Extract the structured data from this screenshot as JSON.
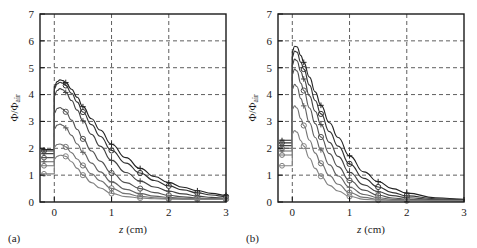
{
  "figure": {
    "panels": [
      {
        "id": "panel-a",
        "label": "(a)",
        "xlabel_italic": "z",
        "xlabel_unit": " (cm)",
        "ylabel_main": "Φ/Φ",
        "ylabel_sub": "air"
      },
      {
        "id": "panel-b",
        "label": "(b)",
        "xlabel_italic": "z",
        "xlabel_unit": " (cm)",
        "ylabel_main": "Φ/Φ",
        "ylabel_sub": "air"
      }
    ]
  },
  "chart_data": [
    {
      "type": "line",
      "panel": "(a)",
      "title": "",
      "xlabel": "z (cm)",
      "ylabel": "Φ/Φair",
      "xlim": [
        -0.25,
        3.0
      ],
      "ylim": [
        0,
        7
      ],
      "xticks": [
        0,
        1,
        2,
        3
      ],
      "yticks": [
        0,
        1,
        2,
        3,
        4,
        5,
        6,
        7
      ],
      "grid": true,
      "grid_style": "dashed",
      "legend": "none",
      "marker_set": [
        "circle",
        "plus"
      ],
      "x": [
        -0.22,
        -0.12,
        -0.03,
        0.0,
        0.05,
        0.1,
        0.15,
        0.2,
        0.3,
        0.4,
        0.5,
        0.65,
        0.8,
        1.0,
        1.25,
        1.5,
        1.75,
        2.0,
        2.25,
        2.5,
        2.75,
        3.0
      ],
      "series": [
        {
          "name": "curve-1",
          "marker": "plus",
          "plateau": 1.95,
          "values": [
            1.95,
            1.95,
            1.95,
            4.3,
            4.48,
            4.55,
            4.52,
            4.45,
            4.2,
            3.9,
            3.55,
            3.1,
            2.68,
            2.15,
            1.65,
            1.25,
            0.95,
            0.72,
            0.55,
            0.42,
            0.32,
            0.25
          ],
          "marker_x": [
            0.2,
            0.5,
            1.0,
            1.5,
            2.0,
            2.5,
            3.0
          ]
        },
        {
          "name": "curve-2",
          "marker": "circle",
          "plateau": 1.9,
          "values": [
            1.9,
            1.9,
            1.9,
            4.22,
            4.4,
            4.46,
            4.42,
            4.34,
            4.05,
            3.72,
            3.35,
            2.88,
            2.45,
            1.92,
            1.45,
            1.08,
            0.8,
            0.6,
            0.45,
            0.34,
            0.26,
            0.2
          ],
          "marker_x": [
            0.2,
            0.5,
            1.0,
            1.5,
            2.0,
            2.5,
            3.0
          ]
        },
        {
          "name": "curve-3",
          "marker": "plus",
          "plateau": 1.8,
          "values": [
            1.8,
            1.8,
            1.8,
            3.95,
            4.15,
            4.22,
            4.18,
            4.08,
            3.78,
            3.42,
            3.02,
            2.52,
            2.08,
            1.55,
            1.1,
            0.78,
            0.56,
            0.4,
            0.3,
            0.22,
            0.17,
            0.14
          ],
          "marker_x": [
            0.2,
            0.5,
            1.0,
            1.5,
            2.0,
            2.5,
            3.0
          ]
        },
        {
          "name": "curve-4",
          "marker": "circle",
          "plateau": 1.65,
          "values": [
            1.65,
            1.65,
            1.65,
            3.3,
            3.48,
            3.52,
            3.46,
            3.36,
            3.05,
            2.7,
            2.35,
            1.9,
            1.52,
            1.08,
            0.72,
            0.5,
            0.35,
            0.25,
            0.19,
            0.15,
            0.13,
            0.12
          ],
          "marker_x": [
            0.2,
            0.5,
            1.0,
            1.5,
            2.0,
            2.5,
            3.0
          ]
        },
        {
          "name": "curve-5",
          "marker": "plus",
          "plateau": 1.5,
          "values": [
            1.5,
            1.5,
            1.5,
            2.72,
            2.86,
            2.9,
            2.85,
            2.76,
            2.48,
            2.16,
            1.85,
            1.45,
            1.12,
            0.75,
            0.47,
            0.31,
            0.22,
            0.17,
            0.14,
            0.13,
            0.12,
            0.11
          ],
          "marker_x": [
            0.2,
            0.5,
            1.0,
            1.5,
            2.0,
            2.5,
            3.0
          ]
        },
        {
          "name": "curve-6",
          "marker": "circle",
          "plateau": 1.35,
          "values": [
            1.35,
            1.35,
            1.35,
            2.05,
            2.14,
            2.16,
            2.12,
            2.05,
            1.84,
            1.6,
            1.36,
            1.05,
            0.79,
            0.51,
            0.31,
            0.21,
            0.16,
            0.13,
            0.12,
            0.11,
            0.11,
            0.1
          ],
          "marker_x": [
            0.2,
            0.5,
            1.0,
            1.5,
            2.0,
            2.5,
            3.0
          ]
        },
        {
          "name": "curve-7",
          "marker": "circle",
          "plateau": 1.05,
          "values": [
            1.05,
            1.05,
            1.05,
            1.6,
            1.7,
            1.74,
            1.73,
            1.7,
            1.5,
            1.25,
            1.0,
            0.72,
            0.52,
            0.32,
            0.2,
            0.15,
            0.12,
            0.11,
            0.1,
            0.1,
            0.1,
            0.1
          ],
          "marker_x": [
            0.2,
            0.5,
            1.0,
            1.5,
            2.0,
            2.5,
            3.0
          ]
        }
      ]
    },
    {
      "type": "line",
      "panel": "(b)",
      "title": "",
      "xlabel": "z (cm)",
      "ylabel": "Φ/Φair",
      "xlim": [
        -0.25,
        3.0
      ],
      "ylim": [
        0,
        7
      ],
      "xticks": [
        0,
        1,
        2,
        3
      ],
      "yticks": [
        0,
        1,
        2,
        3,
        4,
        5,
        6,
        7
      ],
      "grid": true,
      "grid_style": "dashed",
      "legend": "none",
      "marker_set": [
        "circle",
        "plus"
      ],
      "x": [
        -0.22,
        -0.12,
        -0.03,
        0.0,
        0.04,
        0.08,
        0.15,
        0.2,
        0.3,
        0.4,
        0.5,
        0.65,
        0.8,
        1.0,
        1.25,
        1.5,
        1.75,
        2.0,
        2.5,
        3.0
      ],
      "series": [
        {
          "name": "curve-1",
          "marker": "plus",
          "plateau": 2.3,
          "values": [
            2.3,
            2.3,
            2.3,
            5.6,
            5.8,
            5.78,
            5.45,
            5.2,
            4.65,
            4.1,
            3.6,
            2.95,
            2.4,
            1.72,
            1.12,
            0.76,
            0.5,
            0.33,
            0.16,
            0.1
          ],
          "marker_x": [
            0.2,
            0.5,
            1.0,
            1.5,
            2.0
          ]
        },
        {
          "name": "curve-2",
          "marker": "circle",
          "plateau": 2.2,
          "values": [
            2.2,
            2.2,
            2.2,
            5.4,
            5.62,
            5.58,
            5.2,
            4.95,
            4.35,
            3.78,
            3.28,
            2.62,
            2.08,
            1.42,
            0.88,
            0.56,
            0.35,
            0.23,
            0.12,
            0.09
          ],
          "marker_x": [
            0.2,
            0.5,
            1.0,
            1.5,
            2.0
          ]
        },
        {
          "name": "curve-3",
          "marker": "plus",
          "plateau": 2.1,
          "values": [
            2.1,
            2.1,
            2.1,
            5.1,
            5.32,
            5.26,
            4.85,
            4.58,
            3.95,
            3.38,
            2.88,
            2.22,
            1.7,
            1.1,
            0.64,
            0.38,
            0.24,
            0.16,
            0.09,
            0.07
          ],
          "marker_x": [
            0.2,
            0.5,
            1.0,
            1.5,
            2.0
          ]
        },
        {
          "name": "curve-4",
          "marker": "circle",
          "plateau": 2.0,
          "values": [
            2.0,
            2.0,
            2.0,
            4.75,
            4.95,
            4.88,
            4.42,
            4.15,
            3.5,
            2.92,
            2.42,
            1.8,
            1.32,
            0.8,
            0.44,
            0.25,
            0.15,
            0.1,
            0.07,
            0.06
          ],
          "marker_x": [
            0.2,
            0.5,
            1.0,
            1.5,
            2.0
          ]
        },
        {
          "name": "curve-5",
          "marker": "plus",
          "plateau": 1.9,
          "values": [
            1.9,
            1.9,
            1.9,
            4.2,
            4.38,
            4.3,
            3.85,
            3.58,
            2.95,
            2.4,
            1.94,
            1.38,
            0.97,
            0.55,
            0.28,
            0.16,
            0.1,
            0.08,
            0.06,
            0.05
          ],
          "marker_x": [
            0.2,
            0.5,
            1.0,
            1.5,
            2.0
          ]
        },
        {
          "name": "curve-6",
          "marker": "circle",
          "plateau": 1.75,
          "values": [
            1.75,
            1.75,
            1.75,
            3.45,
            3.58,
            3.5,
            3.1,
            2.85,
            2.3,
            1.82,
            1.44,
            0.98,
            0.66,
            0.35,
            0.17,
            0.1,
            0.07,
            0.06,
            0.05,
            0.04
          ],
          "marker_x": [
            0.2,
            0.5,
            1.0,
            1.5,
            2.0
          ]
        },
        {
          "name": "curve-7",
          "marker": "circle",
          "plateau": 1.35,
          "values": [
            1.35,
            1.35,
            1.35,
            2.55,
            2.66,
            2.6,
            2.28,
            2.08,
            1.63,
            1.25,
            0.96,
            0.62,
            0.41,
            0.21,
            0.1,
            0.07,
            0.06,
            0.05,
            0.04,
            0.04
          ],
          "marker_x": [
            0.2,
            0.5,
            1.0,
            1.5,
            2.0
          ]
        }
      ]
    }
  ]
}
